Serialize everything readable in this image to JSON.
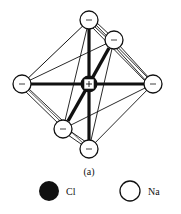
{
  "figure": {
    "caption": "(a)",
    "center_ion": {
      "sign": "+",
      "fill": "#111111"
    },
    "outer_ion_sign": "−",
    "colors": {
      "ink": "#111111",
      "paper": "#ffffff"
    }
  },
  "legend": {
    "items": [
      {
        "label": "Cl",
        "swatch": "filled-circle",
        "fill": "#111111"
      },
      {
        "label": "Na",
        "swatch": "open-circle",
        "fill": "#ffffff"
      }
    ]
  }
}
